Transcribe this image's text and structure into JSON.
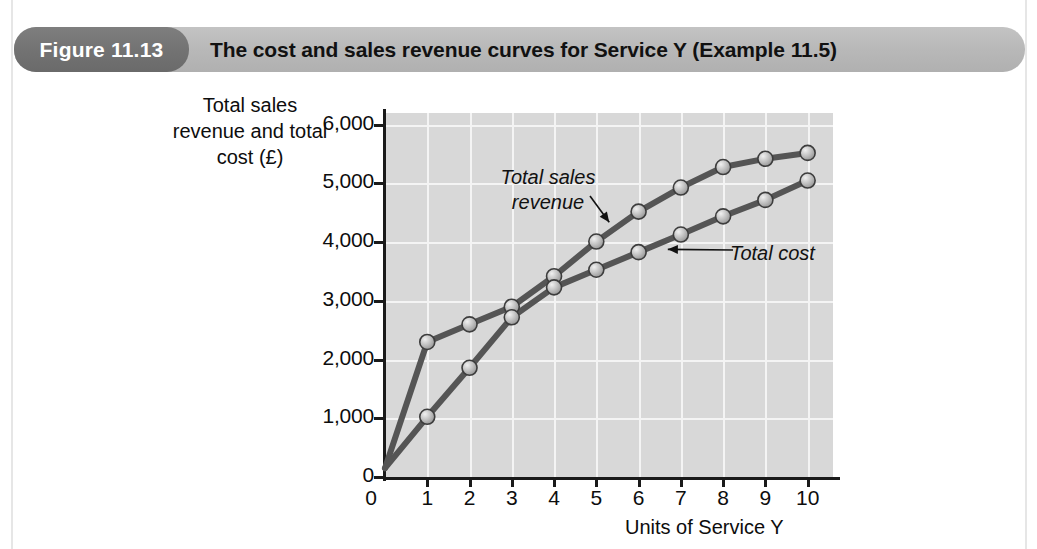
{
  "figure": {
    "number_label": "Figure 11.13",
    "title": "The cost and sales revenue curves for Service Y (Example 11.5)",
    "pill_color": "#737373",
    "band_color": "#b9b9b9"
  },
  "chart_data": {
    "type": "line",
    "title": "The cost and sales revenue curves for Service Y (Example 11.5)",
    "xlabel": "Units of Service Y",
    "ylabel": "Total sales revenue and total cost (£)",
    "x": [
      0,
      1,
      2,
      3,
      4,
      5,
      6,
      7,
      8,
      9,
      10
    ],
    "xlim": [
      0,
      10.6
    ],
    "ylim": [
      0,
      6200
    ],
    "xticks": [
      "0",
      "1",
      "2",
      "3",
      "4",
      "5",
      "6",
      "7",
      "8",
      "9",
      "10"
    ],
    "yticks": [
      "0",
      "1,000",
      "2,000",
      "3,000",
      "4,000",
      "5,000",
      "6,000"
    ],
    "ytick_values": [
      0,
      1000,
      2000,
      3000,
      4000,
      5000,
      6000
    ],
    "grid": true,
    "grid_color": "#f4f4f4",
    "plot_background": "#d8d8d8",
    "line_color": "#555555",
    "marker_color": "#b5b5b5",
    "legend": "annotations",
    "series": [
      {
        "name": "Total sales revenue",
        "values": [
          150,
          2300,
          2600,
          2900,
          3420,
          4010,
          4520,
          4930,
          5280,
          5420,
          5520
        ]
      },
      {
        "name": "Total cost",
        "values": [
          150,
          1025,
          1860,
          2720,
          3230,
          3530,
          3830,
          4130,
          4440,
          4720,
          5050
        ]
      }
    ],
    "annotations": [
      {
        "text": "Total sales revenue",
        "target_x": 5.4,
        "target_y": 4270
      },
      {
        "text": "Total cost",
        "target_x": 6.55,
        "target_y": 3980
      }
    ]
  }
}
